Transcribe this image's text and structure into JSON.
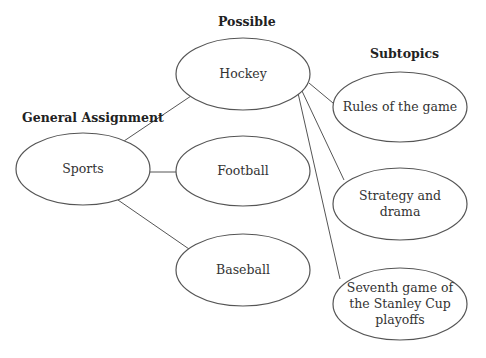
{
  "diagram": {
    "type": "topic-narrowing-map",
    "headings": {
      "general": "General Assignment",
      "possible": "Possible",
      "subtopics": "Subtopics"
    },
    "nodes": {
      "sports": "Sports",
      "hockey": "Hockey",
      "football": "Football",
      "baseball": "Baseball",
      "rules": "Rules of the game",
      "strategy_line1": "Strategy and",
      "strategy_line2": "drama",
      "seventh_line1": "Seventh game of",
      "seventh_line2": "the Stanley Cup",
      "seventh_line3": "playoffs"
    },
    "edges": [
      {
        "from": "Sports",
        "to": "Hockey"
      },
      {
        "from": "Sports",
        "to": "Football"
      },
      {
        "from": "Sports",
        "to": "Baseball"
      },
      {
        "from": "Hockey",
        "to": "Rules of the game"
      },
      {
        "from": "Hockey",
        "to": "Strategy and drama"
      },
      {
        "from": "Hockey",
        "to": "Seventh game of the Stanley Cup playoffs"
      }
    ],
    "colors": {
      "stroke": "#555555",
      "text": "#333333",
      "background": "#ffffff"
    }
  }
}
